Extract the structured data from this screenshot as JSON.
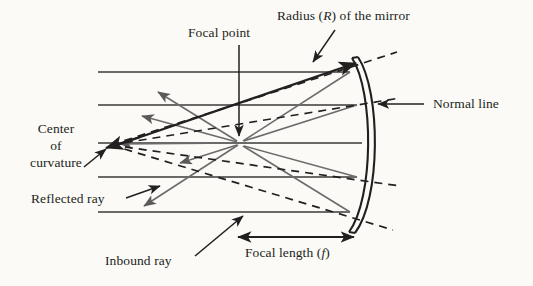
{
  "figure": {
    "background_color": "#fbfaf7",
    "ink_color": "#231f20",
    "ray_color": "#5a5a5a"
  },
  "labels": {
    "focal_point": "Focal point",
    "radius_text_a": "Radius (",
    "radius_text_r": "R",
    "radius_text_b": ") of the mirror",
    "normal_line": "Normal line",
    "center_line1": "Center",
    "center_line2": "of",
    "center_line3": "curvature",
    "reflected_ray": "Reflected ray",
    "inbound_ray": "Inbound ray",
    "focal_length_a": "Focal length (",
    "focal_length_f": "f",
    "focal_length_b": ")"
  },
  "geometry": {
    "mirror": {
      "vertex_x": 362,
      "top_y": 58,
      "bottom_y": 232,
      "thickness": 6,
      "description": "concave mirror arc, double-line band, concave toward left"
    },
    "focal_point": {
      "x": 240,
      "y": 143
    },
    "center_of_curvature": {
      "x": 111,
      "y": 145
    },
    "optical_axis_y": 143,
    "inbound_ray_lines_y": [
      72,
      105,
      143,
      177,
      212
    ],
    "inbound_ray_start_x": 98,
    "focal_length_arrow": {
      "x1": 236,
      "x2": 356,
      "y": 237
    },
    "radius_line": {
      "x1": 111,
      "y1": 145,
      "x2": 357,
      "y2": 62
    }
  }
}
